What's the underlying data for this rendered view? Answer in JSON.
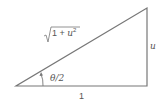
{
  "diagram": {
    "type": "right-triangle",
    "colors": {
      "stroke": "#777777",
      "text": "#555555"
    },
    "labels": {
      "hypotenuse": {
        "prefix": "1 + ",
        "var": "u",
        "exp": "2"
      },
      "opposite": "u",
      "adjacent": "1",
      "angle": "θ/2"
    }
  }
}
